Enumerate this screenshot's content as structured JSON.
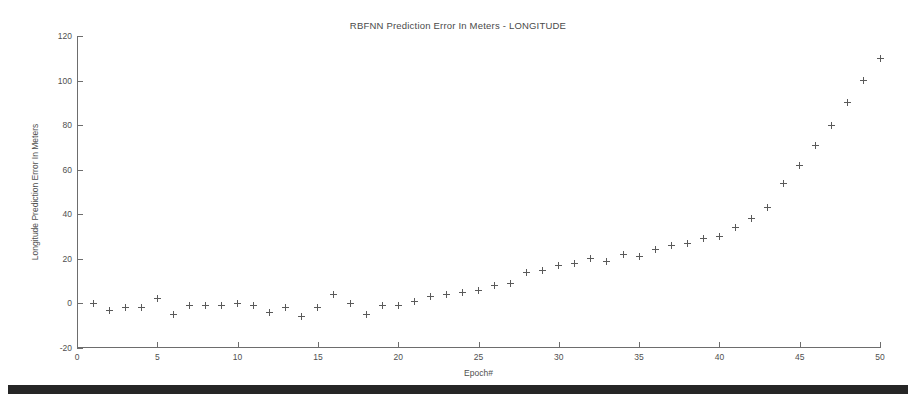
{
  "chart_data": {
    "type": "scatter",
    "title": "RBFNN Prediction Error In Meters - LONGITUDE",
    "xlabel": "Epoch#",
    "ylabel": "Longitude Prediction Error In Meters",
    "xlim": [
      0,
      50
    ],
    "ylim": [
      -20,
      120
    ],
    "xticks": [
      0,
      5,
      10,
      15,
      20,
      25,
      30,
      35,
      40,
      45,
      50
    ],
    "yticks": [
      -20,
      0,
      20,
      40,
      60,
      80,
      100,
      120
    ],
    "xticklabels": [
      "0",
      "5",
      "10",
      "15",
      "20",
      "25",
      "30",
      "35",
      "40",
      "45",
      "50"
    ],
    "yticklabels": [
      "-20",
      "0",
      "20",
      "40",
      "60",
      "80",
      "100",
      "120"
    ],
    "grid": false,
    "legend": null,
    "marker": "plus",
    "marker_color": "#5a5a5a",
    "series": [
      {
        "name": "Longitude prediction error",
        "x": [
          1,
          2,
          3,
          4,
          5,
          6,
          7,
          8,
          9,
          10,
          11,
          12,
          13,
          14,
          15,
          16,
          17,
          18,
          19,
          20,
          21,
          22,
          23,
          24,
          25,
          26,
          27,
          28,
          29,
          30,
          31,
          32,
          33,
          34,
          35,
          36,
          37,
          38,
          39,
          40,
          41,
          42,
          43,
          44,
          45,
          46,
          47,
          48,
          49,
          50
        ],
        "values": [
          0,
          -3,
          -2,
          -2,
          2,
          -5,
          -1,
          -1,
          -1,
          0,
          -1,
          -4,
          -2,
          -6,
          -2,
          4,
          0,
          -5,
          -1,
          -1,
          1,
          3,
          4,
          5,
          6,
          8,
          9,
          14,
          15,
          17,
          18,
          20,
          19,
          22,
          21,
          24,
          26,
          27,
          29,
          30,
          34,
          38,
          43,
          54,
          62,
          71,
          80,
          90,
          100,
          110
        ]
      }
    ]
  },
  "figure": {
    "background_color": "#ffffff",
    "axis_color": "#6d6d6d",
    "text_color": "#4f4f4f"
  },
  "artifacts": {
    "scan_bar_color": "#262626"
  }
}
